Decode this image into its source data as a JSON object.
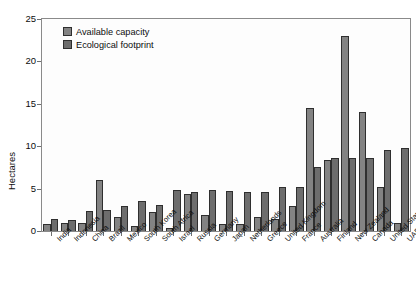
{
  "chart_data": {
    "type": "bar",
    "title": "",
    "xlabel": "",
    "ylabel": "Hectares",
    "ylim": [
      0,
      25
    ],
    "yticks": [
      0,
      5,
      10,
      15,
      20,
      25
    ],
    "grid": false,
    "legend_position": "top-left",
    "categories": [
      "India",
      "Indonesia",
      "China",
      "Brazil",
      "Mexico",
      "South Korea",
      "South Africa",
      "Israel",
      "Russia",
      "Germany",
      "Japan",
      "Netherlands",
      "Greece",
      "United Kingdom",
      "France",
      "Australia",
      "Finland",
      "New Zealand",
      "Canada",
      "United States",
      "UAE"
    ],
    "series": [
      {
        "name": "Available capacity",
        "color": "#838383",
        "values": [
          0.8,
          1.0,
          0.9,
          6.0,
          1.7,
          0.6,
          2.3,
          0.3,
          4.4,
          1.9,
          0.8,
          0.8,
          1.7,
          1.4,
          3.0,
          14.5,
          8.4,
          23.0,
          14.0,
          5.2,
          1.0
        ]
      },
      {
        "name": "Ecological footprint",
        "color": "#6d6d6d",
        "values": [
          1.4,
          1.3,
          2.4,
          2.5,
          2.9,
          3.5,
          3.1,
          4.8,
          4.6,
          4.8,
          4.7,
          4.6,
          4.6,
          5.2,
          5.2,
          7.6,
          8.6,
          8.6,
          8.6,
          9.5,
          9.8
        ]
      }
    ]
  },
  "legend": {
    "items": [
      {
        "label": "Available capacity"
      },
      {
        "label": "Ecological footprint"
      }
    ]
  }
}
